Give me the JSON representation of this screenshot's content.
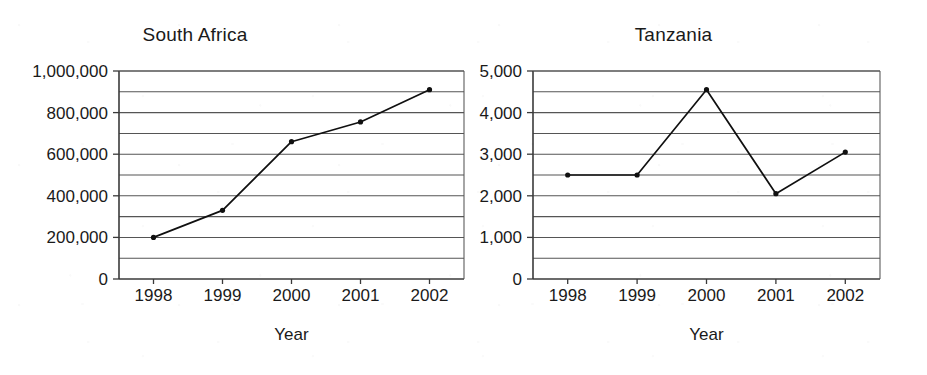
{
  "figure": {
    "width": 927,
    "height": 375,
    "background": "#ffffff",
    "ink_color": "#101010",
    "grid_color": "#555555"
  },
  "chart_data": [
    {
      "type": "line",
      "title": "South Africa",
      "xlabel": "Year",
      "ylabel": "",
      "categories": [
        "1998",
        "1999",
        "2000",
        "2001",
        "2002"
      ],
      "values": [
        200000,
        330000,
        660000,
        755000,
        910000
      ],
      "series": [
        {
          "name": "South Africa",
          "values": [
            200000,
            330000,
            660000,
            755000,
            910000
          ]
        }
      ],
      "ylim": [
        0,
        1000000
      ],
      "ytick_labels": [
        "0",
        "200,000",
        "400,000",
        "600,000",
        "800,000",
        "1,000,000"
      ],
      "ytick_values": [
        0,
        200000,
        400000,
        600000,
        800000,
        1000000
      ],
      "gridline_step": 100000,
      "grid": true,
      "legend": "none",
      "markers": "dot"
    },
    {
      "type": "line",
      "title": "Tanzania",
      "xlabel": "Year",
      "ylabel": "",
      "categories": [
        "1998",
        "1999",
        "2000",
        "2001",
        "2002"
      ],
      "values": [
        2500,
        2500,
        4550,
        2050,
        3050
      ],
      "series": [
        {
          "name": "Tanzania",
          "values": [
            2500,
            2500,
            4550,
            2050,
            3050
          ]
        }
      ],
      "ylim": [
        0,
        5000
      ],
      "ytick_labels": [
        "0",
        "1,000",
        "2,000",
        "3,000",
        "4,000",
        "5,000"
      ],
      "ytick_values": [
        0,
        1000,
        2000,
        3000,
        4000,
        5000
      ],
      "gridline_step": 500,
      "grid": true,
      "legend": "none",
      "markers": "dot"
    }
  ]
}
